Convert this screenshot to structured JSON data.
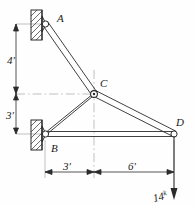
{
  "figure": {
    "name": "truss-free-body-diagram",
    "type": "statics-truss-diagram",
    "background_color": "#fefefe",
    "line_color": "#2b2b2b",
    "centerline_color": "#9a9a9a"
  },
  "joints": [
    {
      "id": "A",
      "label": "A",
      "x": 45,
      "y": 24,
      "support": "pin-on-wall"
    },
    {
      "id": "B",
      "label": "B",
      "x": 45,
      "y": 134,
      "support": "pin-on-wall"
    },
    {
      "id": "C",
      "label": "C",
      "x": 94,
      "y": 94,
      "support": "free"
    },
    {
      "id": "D",
      "label": "D",
      "x": 174,
      "y": 134,
      "support": "free"
    }
  ],
  "members": [
    {
      "from": "A",
      "to": "C"
    },
    {
      "from": "C",
      "to": "D"
    },
    {
      "from": "B",
      "to": "C"
    },
    {
      "from": "B",
      "to": "D"
    }
  ],
  "dimensions": {
    "vertical": [
      {
        "label": "4'",
        "value": 4,
        "unit": "ft",
        "from": "A",
        "to": "C-level"
      },
      {
        "label": "3'",
        "value": 3,
        "unit": "ft",
        "from": "C-level",
        "to": "B"
      }
    ],
    "horizontal": [
      {
        "label": "3'",
        "value": 3,
        "unit": "ft",
        "from": "B",
        "to": "C-line"
      },
      {
        "label": "6'",
        "value": 6,
        "unit": "ft",
        "from": "C-line",
        "to": "D"
      }
    ]
  },
  "load": {
    "label_number": "14",
    "label_exponent": "k",
    "full_label": "14ᵏ",
    "magnitude": 14,
    "unit": "kips",
    "direction": "down",
    "applied_at": "D"
  }
}
